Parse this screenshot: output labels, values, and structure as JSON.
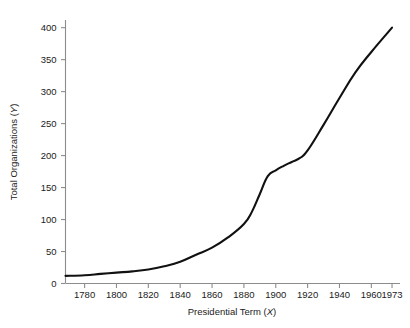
{
  "chart_data": {
    "type": "line",
    "title": "",
    "subtitle": "",
    "xlabel": "Presidential Term (X)",
    "ylabel": "Total Organizations (Y)",
    "xlabel_axis_symbol": "X",
    "ylabel_axis_symbol": "Y",
    "xlabel_prefix": "Presidential Term (",
    "ylabel_prefix": "Total Organizations (",
    "label_suffix": ")",
    "xlim": [
      1768,
      1978
    ],
    "ylim": [
      0,
      412
    ],
    "grid": false,
    "legend": false,
    "legend_position": "none",
    "xticks": [
      1780,
      1800,
      1820,
      1840,
      1860,
      1880,
      1900,
      1920,
      1940,
      1960,
      1973
    ],
    "xtick_labels": [
      "1780",
      "1800",
      "1820",
      "1840",
      "1860",
      "1880",
      "1900",
      "1920",
      "1940",
      "1960",
      "1973"
    ],
    "yticks": [
      0,
      50,
      100,
      150,
      200,
      250,
      300,
      350,
      400
    ],
    "ytick_labels": [
      "0",
      "50",
      "100",
      "150",
      "200",
      "250",
      "300",
      "350",
      "400"
    ],
    "line_color": "#111111",
    "axis_color": "#8c8c8c",
    "background_color": "#ffffff",
    "series": [
      {
        "name": "Total Organizations",
        "x": [
          1768,
          1780,
          1790,
          1800,
          1810,
          1820,
          1830,
          1840,
          1850,
          1860,
          1870,
          1880,
          1885,
          1890,
          1895,
          1900,
          1905,
          1910,
          1915,
          1920,
          1930,
          1940,
          1950,
          1960,
          1973
        ],
        "values": [
          12,
          13,
          15,
          17,
          19,
          22,
          27,
          34,
          45,
          56,
          72,
          93,
          112,
          140,
          168,
          177,
          184,
          190,
          196,
          208,
          248,
          290,
          330,
          362,
          400
        ]
      }
    ]
  }
}
